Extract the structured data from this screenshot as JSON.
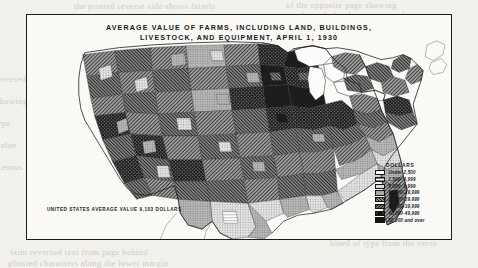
{
  "plate": {
    "title_line_1": "AVERAGE VALUE OF FARMS, INCLUDING LAND, BUILDINGS,",
    "title_line_2": "LIVESTOCK, AND EQUIPMENT, APRIL 1, 1930",
    "us_average_note": "UNITED STATES AVERAGE VALUE 9,103 DOLLARS"
  },
  "legend": {
    "title": "DOLLARS",
    "rows": [
      {
        "label": "Under  2,500",
        "swatch": "sw0"
      },
      {
        "label": "2,500-  4,999",
        "swatch": "sw1"
      },
      {
        "label": "5,000-  9,999",
        "swatch": "sw2"
      },
      {
        "label": "10,000-19,999",
        "swatch": "sw3"
      },
      {
        "label": "20,000-29,999",
        "swatch": "sw4"
      },
      {
        "label": "30,000-39,999",
        "swatch": "sw5"
      },
      {
        "label": "40,000-49,999",
        "swatch": "sw6"
      },
      {
        "label": "50,000 and over",
        "swatch": "sw7"
      }
    ]
  },
  "showthrough": {
    "line_1": "the printed reverse side shows faintly",
    "line_2": "of the opposite page showing",
    "line_3": "through the thin paper stock",
    "line_4": "faint reversed text from page behind",
    "line_5": "bleed of type from the verso",
    "line_6": "ghosted characters along the lower margin",
    "left_1": "reversed",
    "left_2": "showing",
    "left_3": "type",
    "left_4": "value",
    "left_5": "census",
    "right_1": "margin"
  }
}
